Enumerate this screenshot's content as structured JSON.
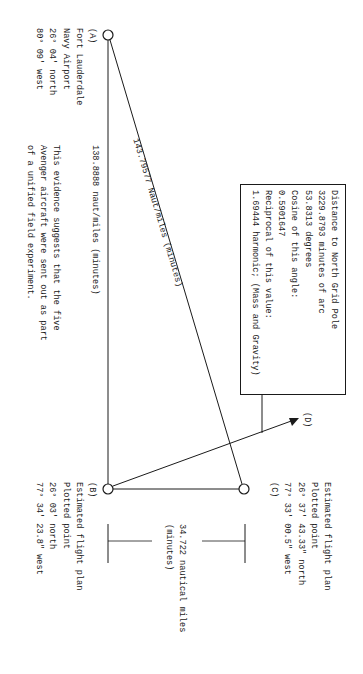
{
  "diagram": {
    "orientation": "rotated-90-clockwise",
    "points": {
      "A": {
        "label": "(A)",
        "lines": [
          "Fort Lauderdale",
          "Navy Airport",
          "26° 04' north",
          "80° 09' west"
        ]
      },
      "B": {
        "label": "(B)",
        "lines": [
          "Estimated flight plan",
          "Plotted point",
          "26° 03'  north",
          "77° 34' 23.8\" west"
        ]
      },
      "C": {
        "label": "(C)",
        "lines": [
          "Estimated flight plan",
          "Plotted point",
          "26° 37' 43.33\" north",
          "77° 33' 00.5\" west"
        ]
      },
      "D": {
        "label": "(D)"
      }
    },
    "edges": {
      "AB": {
        "label": "138.8888 naut/miles  (minutes)"
      },
      "AC": {
        "label": "143.79577 Naut/miles (minutes)"
      },
      "BC": {
        "label_line1": "34.722 nautical miles",
        "label_line2": "(minutes)"
      },
      "BD": {
        "arrow": true
      }
    },
    "note_box": {
      "lines": [
        "Distance to North Grid Pole",
        "3229.8793 minutes of arc",
        "53.8313 degrees",
        "Cosine of this angle:",
        "0.5901647",
        "Reciprocal of this value:",
        "1.69444 harmonic; (Mass and Gravity)"
      ]
    },
    "evidence_note": {
      "lines": [
        "This evidence suggests that the five",
        "Avenger aircraft were sent out as part",
        "of a unified field experiment."
      ]
    }
  }
}
